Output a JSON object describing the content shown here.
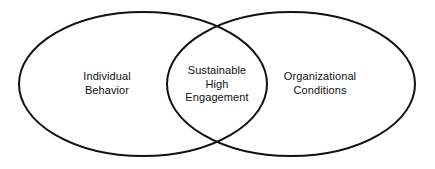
{
  "diagram": {
    "type": "venn",
    "background_color": "#ffffff",
    "stroke_color": "#111111",
    "stroke_width": 2,
    "text_color": "#111111",
    "sets": [
      {
        "id": "individual-behavior",
        "position": "left",
        "lines": [
          "Individual",
          "Behavior"
        ],
        "line1": "Individual",
        "line2": "Behavior",
        "center_x": 143,
        "center_y": 84,
        "radius_x": 124,
        "radius_y": 72,
        "label_x": 107,
        "label_y": 84
      },
      {
        "id": "organizational-conditions",
        "position": "right",
        "lines": [
          "Organizational",
          "Conditions"
        ],
        "line1": "Organizational",
        "line2": "Conditions",
        "center_x": 291,
        "center_y": 84,
        "radius_x": 124,
        "radius_y": 72,
        "label_x": 320,
        "label_y": 84
      }
    ],
    "intersection": {
      "id": "sustainable-high-engagement",
      "position": "center",
      "lines": [
        "Sustainable",
        "High",
        "Engagement"
      ],
      "line1": "Sustainable",
      "line2": "High",
      "line3": "Engagement",
      "label_x": 217,
      "label_y": 84,
      "crossing_top_x": 217,
      "crossing_top_y": 24,
      "crossing_bottom_x": 217,
      "crossing_bottom_y": 145
    }
  }
}
